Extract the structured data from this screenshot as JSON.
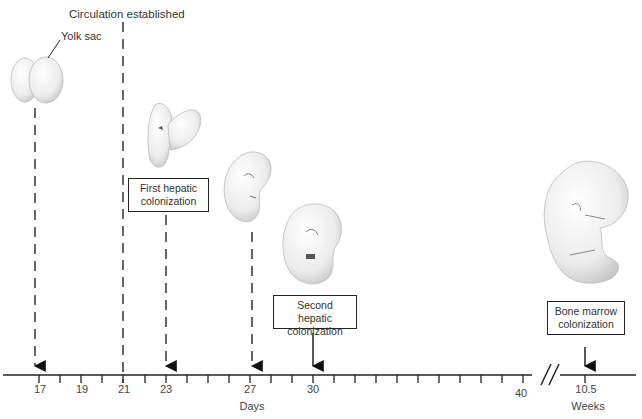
{
  "diagram": {
    "title_annotation": "Circulation established",
    "yolk_sac_label": "Yolk sac",
    "axis": {
      "days_label": "Days",
      "weeks_label": "Weeks",
      "day_ticks": [
        17,
        18,
        19,
        20,
        21,
        22,
        23,
        24,
        25,
        26,
        27,
        28,
        29,
        30,
        31,
        32,
        33,
        34,
        35,
        36,
        37,
        38,
        39,
        40
      ],
      "labeled_days": [
        "17",
        "19",
        "21",
        "23",
        "27",
        "30",
        "40"
      ],
      "week_tick": "10.5",
      "axis_break": "//"
    },
    "events": [
      {
        "name": "yolk-sac-stage",
        "day": "17",
        "label": ""
      },
      {
        "name": "circulation-established",
        "day": "21",
        "label": "Circulation established"
      },
      {
        "name": "first-hepatic-colonization",
        "day": "23",
        "label_line1": "First hepatic",
        "label_line2": "colonization"
      },
      {
        "name": "embryo-day-27",
        "day": "27",
        "label": ""
      },
      {
        "name": "second-hepatic-colonization",
        "day": "30",
        "label_line1": "Second hepatic",
        "label_line2": "colonization"
      },
      {
        "name": "bone-marrow-colonization",
        "week": "10.5",
        "label_line1": "Bone marrow",
        "label_line2": "colonization"
      }
    ],
    "colors": {
      "line": "#222222",
      "text": "#333333",
      "embryo_fill": "#eeeeee",
      "embryo_shade": "#cfcfcf"
    }
  }
}
